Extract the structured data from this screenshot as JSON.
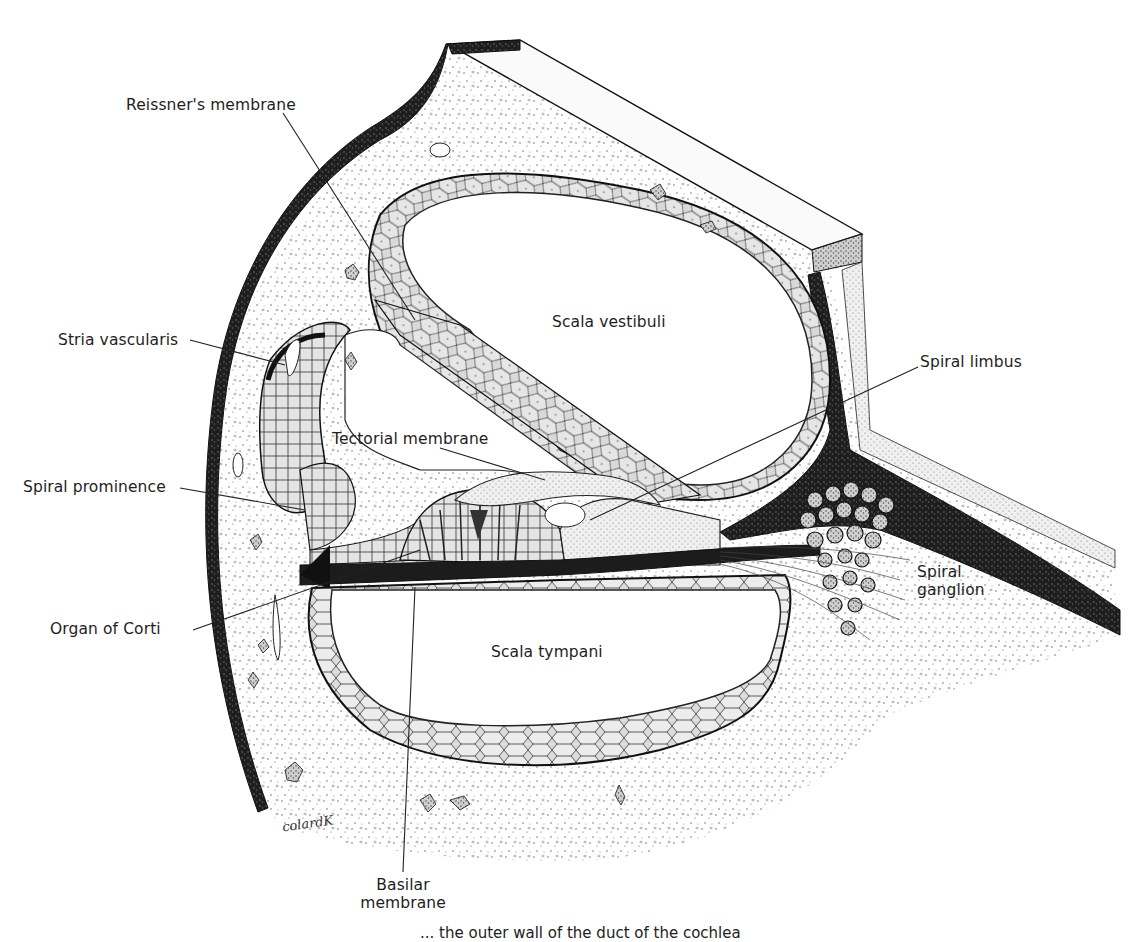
{
  "figure": {
    "colors": {
      "ink": "#1a1a1a",
      "bone_fill": "#f7f7f7",
      "tissue_shade": "#bdbdbd",
      "dark_bone": "#222222",
      "background": "#ffffff"
    }
  },
  "labels": {
    "reissners_membrane": "Reissner's membrane",
    "stria_vascularis": "Stria vascularis",
    "spiral_prominence": "Spiral prominence",
    "organ_of_corti": "Organ of Corti",
    "tectorial_membrane": "Tectorial membrane",
    "scala_vestibuli": "Scala vestibuli",
    "scala_tympani": "Scala tympani",
    "spiral_limbus": "Spiral limbus",
    "spiral_ganglion_line1": "Spiral",
    "spiral_ganglion_line2": "ganglion",
    "basilar_membrane_line1": "Basilar",
    "basilar_membrane_line2": "membrane"
  },
  "signature": "colardK",
  "caption": "... the outer wall of the duct of the cochlea"
}
